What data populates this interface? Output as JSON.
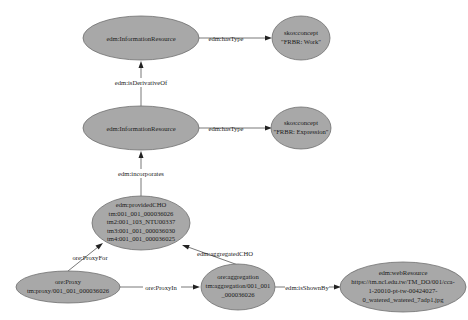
{
  "diagram": {
    "colors": {
      "node_fill": "#a8a8a8",
      "node_stroke": "#6e6e6e",
      "edge": "#555555",
      "text": "#1a1a1a"
    },
    "nodes": {
      "info_resource_work": {
        "lines": [
          "edm:InformationResource"
        ]
      },
      "concept_work": {
        "lines": [
          "skos:concept",
          "\"FRBR: Work\""
        ]
      },
      "info_resource_expression": {
        "lines": [
          "edm:InformationResource"
        ]
      },
      "concept_expression": {
        "lines": [
          "skos:concept",
          "\"FRBR: Expression\""
        ]
      },
      "provided_cho": {
        "lines": [
          "edm:providedCHO",
          "tm:001_001_000036026",
          "tm2:001_103_NTU00337",
          "tm3:001_001_000036030",
          "tm4:001_001_000036025"
        ]
      },
      "proxy": {
        "lines": [
          "ore:Proxy",
          "tm:proxy/001_001_000036026"
        ]
      },
      "aggregation": {
        "lines": [
          "ore:aggregation",
          "tm:aggregation/001_001",
          "_000036026"
        ]
      },
      "web_resource": {
        "lines": [
          "edm:webResource",
          "https://tm.ncl.edu.tw/TM_DO/001/cca-",
          "1-20010-pt-tw-00424027-",
          "0_watered_watered_7adp1.jpg"
        ]
      }
    },
    "edges": {
      "has_type_work": "edm:hasType",
      "is_derivative_of": "edm:isDerivativeOf",
      "has_type_expression": "edm:hasType",
      "incorporates": "edm:incorporates",
      "proxy_for": "ore:ProxyFor",
      "aggregated_cho": "edm:aggregatedCHO",
      "proxy_in": "ore:ProxyIn",
      "is_shown_by": "edm:isShownBy"
    }
  }
}
